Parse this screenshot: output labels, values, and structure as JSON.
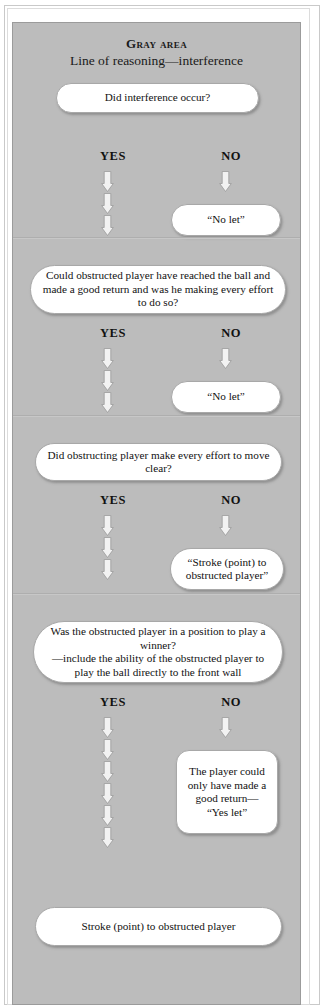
{
  "header": {
    "title": "Gray area",
    "subtitle": "Line of reasoning—interference"
  },
  "branch_labels": {
    "yes": "YES",
    "no": "NO"
  },
  "sections": [
    {
      "id": "section-1",
      "question": "Did interference occur?",
      "yes_label": "YES",
      "no_label": "NO",
      "no_outcome": "“No let”"
    },
    {
      "id": "section-2",
      "question": "Could obstructed player have reached the ball and made a good return and was he making every effort to do so?",
      "yes_label": "YES",
      "no_label": "NO",
      "no_outcome": "“No let”"
    },
    {
      "id": "section-3",
      "question": "Did obstructing player make every effort to move clear?",
      "yes_label": "YES",
      "no_label": "NO",
      "no_outcome": "“Stroke (point) to obstructed player”"
    },
    {
      "id": "section-4",
      "question": "Was the obstructed player in a position to play a winner?\n—include the ability of the obstructed player to play the ball directly to the front wall",
      "yes_label": "YES",
      "no_label": "NO",
      "no_outcome": "The player could only have made a good return—\n“Yes let”"
    }
  ],
  "final_outcome": "Stroke (point) to obstructed player",
  "colors": {
    "panel_background": "#bcbcbc",
    "panel_border": "#9b9b9b",
    "node_fill": "#ffffff",
    "node_border": "#a8a8a8",
    "text": "#111111",
    "page_background": "#ffffff",
    "arrow_fill": "#f2f2f2",
    "arrow_stroke": "#9a9a9a",
    "divider": "#aeaeae"
  },
  "icons": {
    "arrow": "down-arrow-icon"
  }
}
